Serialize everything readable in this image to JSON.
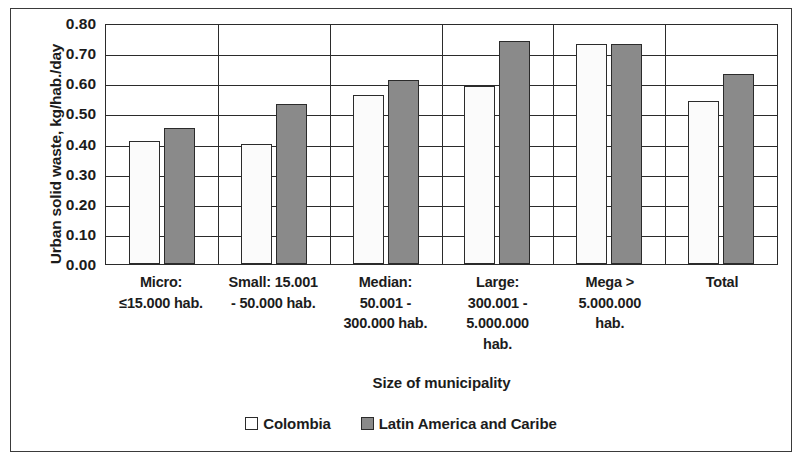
{
  "chart_data": {
    "type": "bar",
    "title": "",
    "subtitle": "",
    "xlabel": "Size of municipality",
    "ylabel": "Urban solid waste, kg/hab./day",
    "ylim": [
      0,
      0.8
    ],
    "ytick_step": 0.1,
    "ytick_labels": [
      "0.80",
      "0.70",
      "0.60",
      "0.50",
      "0.40",
      "0.30",
      "0.20",
      "0.10",
      "0.00"
    ],
    "ytick_values": [
      0.8,
      0.7,
      0.6,
      0.5,
      0.4,
      0.3,
      0.2,
      0.1,
      0.0
    ],
    "grid": "horizontal-and-vertical",
    "legend_position": "bottom-center",
    "categories": [
      "Micro:\n≤15.000 hab.",
      "Small: 15.001\n- 50.000 hab.",
      "Median:\n50.001 -\n300.000 hab.",
      "Large:\n300.001 -\n5.000.000\nhab.",
      "Mega >\n5.000.000\nhab.",
      "Total"
    ],
    "series": [
      {
        "name": "Colombia",
        "color": "#FBFBFB",
        "values": [
          0.41,
          0.4,
          0.56,
          0.59,
          0.73,
          0.54
        ]
      },
      {
        "name": "Latin America and Caribe",
        "color": "#8A8A8A",
        "values": [
          0.45,
          0.53,
          0.61,
          0.74,
          0.73,
          0.63
        ]
      }
    ]
  },
  "axes": {
    "y_title": "Urban solid waste, kg/hab./day",
    "x_title": "Size of municipality"
  },
  "legend": {
    "items": [
      {
        "label": "Colombia",
        "swatch": "hollow-square-swatch"
      },
      {
        "label": "Latin America and Caribe",
        "swatch": "filled-square-swatch"
      }
    ]
  },
  "style": {
    "axis_color": "#2B2B2B",
    "frame_color": "#3A3A3A",
    "series0_fill": "#FBFBFB",
    "series1_fill": "#8A8A8A",
    "background": "#FFFFFF"
  }
}
